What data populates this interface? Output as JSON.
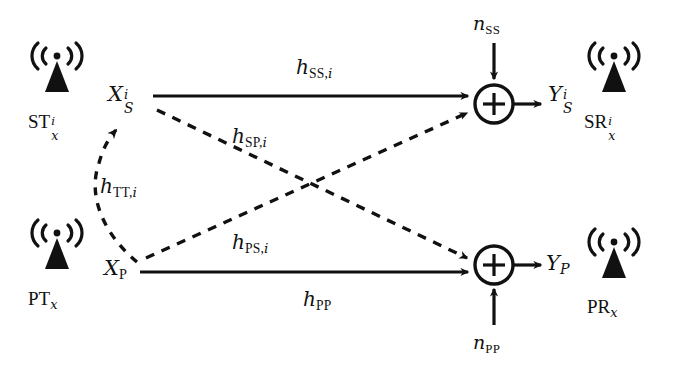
{
  "figure": {
    "type": "block-diagram",
    "background_color": "#ffffff",
    "line_color": "#111111"
  },
  "nodes": {
    "secondary_tx": {
      "icon": "antenna-icon",
      "label_base": "ST",
      "label_sup": "i",
      "label_sub": "x",
      "signal_base": "X",
      "signal_sup": "i",
      "signal_sub": "S"
    },
    "primary_tx": {
      "icon": "antenna-icon",
      "label_base": "PT",
      "label_sup": "",
      "label_sub": "x",
      "signal_base": "X",
      "signal_sup": "",
      "signal_sub": "P"
    },
    "secondary_rx": {
      "icon": "antenna-icon",
      "label_base": "SR",
      "label_sup": "i",
      "label_sub": "x",
      "signal_base": "Y",
      "signal_sup": "i",
      "signal_sub": "S"
    },
    "primary_rx": {
      "icon": "antenna-icon",
      "label_base": "PR",
      "label_sup": "",
      "label_sub": "x",
      "signal_base": "Y",
      "signal_sup": "",
      "signal_sub": "P"
    }
  },
  "adders": {
    "secondary": {
      "glyph": "+",
      "name": "summation-node-secondary"
    },
    "primary": {
      "glyph": "+",
      "name": "summation-node-primary"
    }
  },
  "channels": [
    {
      "id": "h_SS_i",
      "base": "h",
      "sub": "SS,",
      "sub_it": "i",
      "style": "solid",
      "name": "channel-label-hss"
    },
    {
      "id": "h_SP_i",
      "base": "h",
      "sub": "SP,",
      "sub_it": "i",
      "style": "dashed",
      "name": "channel-label-hsp"
    },
    {
      "id": "h_PS_i",
      "base": "h",
      "sub": "PS,",
      "sub_it": "i",
      "style": "dashed",
      "name": "channel-label-hps"
    },
    {
      "id": "h_PP",
      "base": "h",
      "sub": "PP",
      "sub_it": "",
      "style": "solid",
      "name": "channel-label-hpp"
    },
    {
      "id": "h_TT_i",
      "base": "h",
      "sub": "TT,",
      "sub_it": "i",
      "style": "dashed",
      "name": "channel-label-htt"
    }
  ],
  "noise": {
    "secondary": {
      "base": "n",
      "sub": "SS"
    },
    "primary": {
      "base": "n",
      "sub": "PP"
    }
  }
}
